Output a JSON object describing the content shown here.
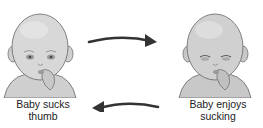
{
  "diagram": {
    "left_node": {
      "label_line1": "Baby sucks",
      "label_line2": "thumb"
    },
    "right_node": {
      "label_line1": "Baby enjoys",
      "label_line2": "sucking"
    },
    "arrows": [
      {
        "from": "left_node",
        "to": "right_node",
        "direction": "right",
        "position": "top"
      },
      {
        "from": "right_node",
        "to": "left_node",
        "direction": "left",
        "position": "bottom"
      }
    ],
    "colors": {
      "skin": "#d6d6d6",
      "shade": "#a9a9a9",
      "outline": "#555555",
      "arrow": "#333333",
      "text": "#222222"
    }
  }
}
